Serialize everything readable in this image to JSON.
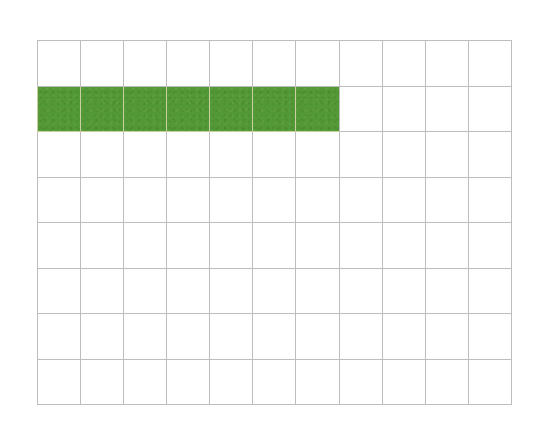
{
  "page": {
    "background_color": "#ffffff"
  },
  "grid": {
    "name": "fraction-grid",
    "columns": 11,
    "rows": 8,
    "line_color": "#bdbdbd",
    "cell_fill_color": "#4e9b2e",
    "empty_cell_color": "#ffffff",
    "filled_cells_count": 7,
    "total_cells": 88,
    "filled_row_index": 1,
    "rows_data": [
      [
        false,
        false,
        false,
        false,
        false,
        false,
        false,
        false,
        false,
        false,
        false
      ],
      [
        true,
        true,
        true,
        true,
        true,
        true,
        true,
        false,
        false,
        false,
        false
      ],
      [
        false,
        false,
        false,
        false,
        false,
        false,
        false,
        false,
        false,
        false,
        false
      ],
      [
        false,
        false,
        false,
        false,
        false,
        false,
        false,
        false,
        false,
        false,
        false
      ],
      [
        false,
        false,
        false,
        false,
        false,
        false,
        false,
        false,
        false,
        false,
        false
      ],
      [
        false,
        false,
        false,
        false,
        false,
        false,
        false,
        false,
        false,
        false,
        false
      ],
      [
        false,
        false,
        false,
        false,
        false,
        false,
        false,
        false,
        false,
        false,
        false
      ],
      [
        false,
        false,
        false,
        false,
        false,
        false,
        false,
        false,
        false,
        false,
        false
      ]
    ]
  },
  "chart_data": {
    "type": "heatmap",
    "title": "",
    "xlabel": "",
    "ylabel": "",
    "columns": 11,
    "rows": 8,
    "legend": [],
    "grid": true,
    "values": [
      [
        0,
        0,
        0,
        0,
        0,
        0,
        0,
        0,
        0,
        0,
        0
      ],
      [
        1,
        1,
        1,
        1,
        1,
        1,
        1,
        0,
        0,
        0,
        0
      ],
      [
        0,
        0,
        0,
        0,
        0,
        0,
        0,
        0,
        0,
        0,
        0
      ],
      [
        0,
        0,
        0,
        0,
        0,
        0,
        0,
        0,
        0,
        0,
        0
      ],
      [
        0,
        0,
        0,
        0,
        0,
        0,
        0,
        0,
        0,
        0,
        0
      ],
      [
        0,
        0,
        0,
        0,
        0,
        0,
        0,
        0,
        0,
        0,
        0
      ],
      [
        0,
        0,
        0,
        0,
        0,
        0,
        0,
        0,
        0,
        0,
        0
      ],
      [
        0,
        0,
        0,
        0,
        0,
        0,
        0,
        0,
        0,
        0,
        0
      ]
    ],
    "colors": {
      "0": "#ffffff",
      "1": "#4e9b2e"
    }
  }
}
